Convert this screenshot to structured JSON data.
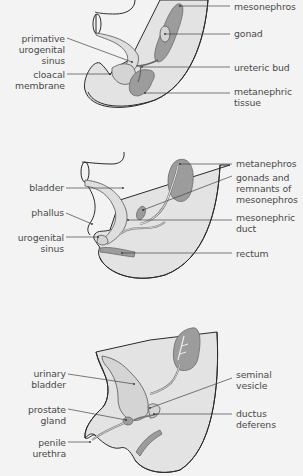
{
  "figure": {
    "panels": [
      {
        "id": "early-embryo",
        "labels_left": [
          {
            "text": "primative\nurogenital\nsinus"
          },
          {
            "text": "cloacal\nmembrane"
          }
        ],
        "labels_right": [
          {
            "text": "mesonephros"
          },
          {
            "text": "gonad"
          },
          {
            "text": "ureteric bud"
          },
          {
            "text": "metanephric\ntissue"
          }
        ]
      },
      {
        "id": "indifferent-stage",
        "labels_left": [
          {
            "text": "bladder"
          },
          {
            "text": "phallus"
          },
          {
            "text": "urogenital\nsinus"
          }
        ],
        "labels_right": [
          {
            "text": "metanephros"
          },
          {
            "text": "gonads and\nremnants of\nmesonephros"
          },
          {
            "text": "mesonephric\nduct"
          },
          {
            "text": "rectum"
          }
        ]
      },
      {
        "id": "male-development",
        "labels_left": [
          {
            "text": "urinary\nbladder"
          },
          {
            "text": "prostate\ngland"
          },
          {
            "text": "penile\nurethra"
          }
        ],
        "labels_right": [
          {
            "text": "seminal\nvesicle"
          },
          {
            "text": "ductus\ndeferens"
          }
        ]
      }
    ],
    "colors": {
      "background": "#f3f3f3",
      "tissue_fill": "#e3e3e3",
      "organ_fill": "#9c9c9c",
      "outline": "#2a2a2a",
      "label_text": "#4a4a4a"
    }
  }
}
